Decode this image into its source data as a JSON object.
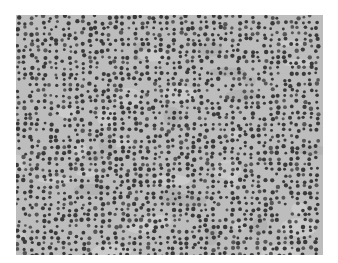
{
  "image": {
    "description": "Grayscale micrograph of densely packed small round cells (lymphoid tissue)",
    "frame": {
      "x": 16,
      "y": 15,
      "width": 307,
      "height": 240
    },
    "colors": {
      "page_background": "#ffffff",
      "tissue_background": "#bdbdbd",
      "light_stroma": "#d6d6d6",
      "pale_patch": "#a9a9a9",
      "nucleus_dark": "#3a3a3a",
      "nucleus_mid": "#555555"
    },
    "texture": {
      "cell_spacing_px": 6.5,
      "cell_radius_px": 1.8,
      "seed": 7
    }
  }
}
